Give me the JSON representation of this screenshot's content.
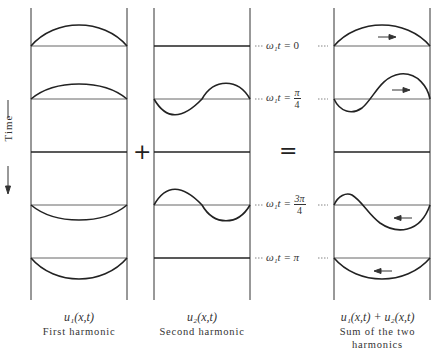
{
  "figure": {
    "time_axis_label": "Time",
    "plus_symbol": "+",
    "equals_symbol": "=",
    "columns": [
      {
        "id": "first",
        "formula": "u₁(x,t)",
        "caption": "First harmonic"
      },
      {
        "id": "second",
        "formula": "u₂(x,t)",
        "caption": "Second harmonic"
      },
      {
        "id": "sum",
        "formula": "u₁(x,t) + u₂(x,t)",
        "caption_line1": "Sum of the two",
        "caption_line2": "harmonics"
      }
    ],
    "time_labels": [
      {
        "prefix": "ω₁t = ",
        "value": "0"
      },
      {
        "prefix": "ω₁t = ",
        "num": "π",
        "den": "4"
      },
      {
        "prefix": "",
        "value": ""
      },
      {
        "prefix": "ω₁t = ",
        "num": "3π",
        "den": "4"
      },
      {
        "prefix": "ω₁t = ",
        "value": "π"
      }
    ],
    "arrows": [
      "right",
      "right",
      "none",
      "left",
      "left"
    ]
  }
}
